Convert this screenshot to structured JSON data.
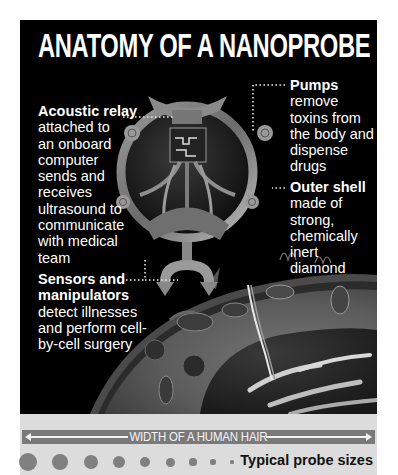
{
  "title": "ANATOMY OF A NANOPROBE",
  "labels": {
    "acoustic": {
      "head": "Acoustic relay",
      "body": "attached to\nan onboard\ncomputer\nsends and\nreceives\nultrasound to\ncommunicate\nwith medical\nteam"
    },
    "pumps": {
      "head": "Pumps",
      "body": "remove\ntoxins from\nthe body and\ndispense\ndrugs"
    },
    "shell": {
      "head": "Outer shell",
      "body": "made of\nstrong,\nchemically\ninert\ndiamond"
    },
    "sensors": {
      "head": "Sensors and\nmanipulators",
      "body": "detect illnesses\nand perform cell-\nby-cell surgery"
    }
  },
  "scale": {
    "hair_label": "WIDTH OF A HUMAN HAIR",
    "sizes_label": "Typical probe sizes",
    "dot_sizes_relative": [
      1.0,
      0.89,
      0.83,
      0.72,
      0.61,
      0.5,
      0.39,
      0.28,
      0.17,
      0.11
    ]
  },
  "colors": {
    "panel": "#000000",
    "text": "#ffffff",
    "scale_bg": "#dcdcdc",
    "hair_bar": "#7a7a7a",
    "dot": "#808080"
  },
  "illustration": {
    "subject": "nanoprobe-injecting-cell",
    "caption": ""
  }
}
